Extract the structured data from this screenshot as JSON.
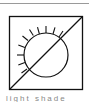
{
  "symbol": {
    "name": "light-shade-symbol",
    "stroke_color": "#111111",
    "background": "#ffffff"
  },
  "caption": {
    "text": "light shade"
  }
}
